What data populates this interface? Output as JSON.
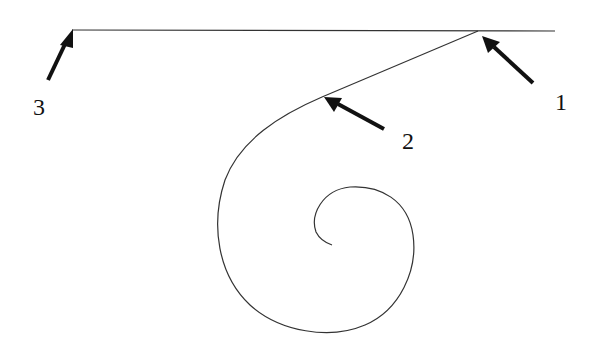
{
  "diagram": {
    "colors": {
      "line": "#333333",
      "arrow": "#111111",
      "background": "#ffffff"
    },
    "labels": [
      {
        "id": "1",
        "text": "1",
        "points_to": "tangent point where diagonal meets horizontal line"
      },
      {
        "id": "2",
        "text": "2",
        "points_to": "point where straight diagonal transitions into spiral"
      },
      {
        "id": "3",
        "text": "3",
        "points_to": "left end of horizontal line"
      }
    ]
  }
}
